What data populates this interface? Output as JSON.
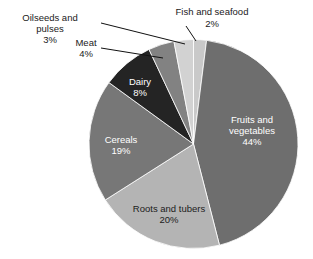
{
  "chart_data": {
    "type": "pie",
    "title": "",
    "subtitle": "",
    "xlabel": "",
    "ylabel": "",
    "legend_position": "none",
    "grid": false,
    "units": "percent",
    "start_angle_deg": 0,
    "direction": "clockwise",
    "categories": [
      "Fish and seafood",
      "Fruits and vegetables",
      "Roots and tubers",
      "Cereals",
      "Dairy",
      "Meat",
      "Oilseeds and pulses"
    ],
    "values": [
      2,
      44,
      20,
      19,
      8,
      4,
      3
    ],
    "slices": [
      {
        "name": "Fish and seafood",
        "value": 2,
        "value_label": "2%",
        "color": "#c9c9c9",
        "label_placement": "outside",
        "label_text_color": "#1a1a1a"
      },
      {
        "name": "Fruits and vegetables",
        "value": 44,
        "value_label": "44%",
        "color": "#6e6e6e",
        "label_placement": "inside",
        "label_text_color": "#ffffff"
      },
      {
        "name": "Roots and tubers",
        "value": 20,
        "value_label": "20%",
        "color": "#b4b4b4",
        "label_placement": "inside",
        "label_text_color": "#1c1c1c"
      },
      {
        "name": "Cereals",
        "value": 19,
        "value_label": "19%",
        "color": "#777777",
        "label_placement": "inside",
        "label_text_color": "#ffffff"
      },
      {
        "name": "Dairy",
        "value": 8,
        "value_label": "8%",
        "color": "#242424",
        "label_placement": "inside",
        "label_text_color": "#ffffff"
      },
      {
        "name": "Meat",
        "value": 4,
        "value_label": "4%",
        "color": "#828282",
        "label_placement": "outside",
        "label_text_color": "#1a1a1a"
      },
      {
        "name": "Oilseeds and pulses",
        "value": 3,
        "value_label": "3%",
        "color": "#d2d2d2",
        "label_placement": "outside",
        "label_text_color": "#1a1a1a"
      }
    ]
  },
  "labels": {
    "oilseeds": {
      "line1": "Oilseeds and",
      "line2": "pulses",
      "line3": "3%"
    },
    "meat": {
      "line1": "Meat",
      "line2": "4%"
    },
    "fish": {
      "line1": "Fish and seafood",
      "line2": "2%"
    },
    "fruits": {
      "line1": "Fruits and",
      "line2": "vegetables",
      "line3": "44%"
    },
    "roots": {
      "line1": "Roots and tubers",
      "line2": "20%"
    },
    "cereals": {
      "line1": "Cereals",
      "line2": "19%"
    },
    "dairy": {
      "line1": "Dairy",
      "line2": "8%"
    }
  }
}
